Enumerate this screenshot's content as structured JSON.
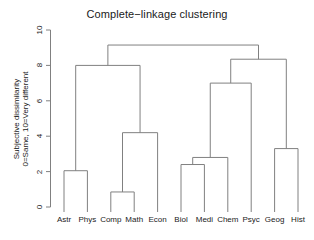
{
  "chart_data": {
    "type": "dendrogram",
    "title": "Complete−linkage clustering",
    "xlabel": "",
    "ylabel": "Subjective dissimilarity\n0=Same, 10=Very different",
    "ylabel_line1": "Subjective dissimilarity",
    "ylabel_line2": "0=Same, 10=Very different",
    "ylim": [
      0,
      10
    ],
    "yticks": [
      0,
      2,
      4,
      6,
      8,
      10
    ],
    "ytick_labels": [
      "0",
      "2",
      "4",
      "6",
      "8",
      "10"
    ],
    "grid": false,
    "legend": "none",
    "leaves": [
      "Astr",
      "Phys",
      "Comp",
      "Math",
      "Econ",
      "Biol",
      "Medi",
      "Chem",
      "Psyc",
      "Geog",
      "Hist"
    ],
    "leaf_positions": [
      1,
      2,
      3,
      4,
      5,
      6,
      7,
      8,
      9,
      10,
      11
    ],
    "merges": [
      {
        "id": "m1",
        "label": "Comp-Math",
        "members": [
          "Comp",
          "Math"
        ],
        "height": 0.85
      },
      {
        "id": "m2",
        "label": "Astr-Phys",
        "members": [
          "Astr",
          "Phys"
        ],
        "height": 2.05
      },
      {
        "id": "m3",
        "label": "Biol-Medi",
        "members": [
          "Biol",
          "Medi"
        ],
        "height": 2.4
      },
      {
        "id": "m4",
        "label": "(Biol,Medi)-Chem",
        "members": [
          "Biol",
          "Medi",
          "Chem"
        ],
        "height": 2.8
      },
      {
        "id": "m5",
        "label": "Geog-Hist",
        "members": [
          "Geog",
          "Hist"
        ],
        "height": 3.3
      },
      {
        "id": "m6",
        "label": "(Comp,Math)-Econ",
        "members": [
          "Comp",
          "Math",
          "Econ"
        ],
        "height": 4.2
      },
      {
        "id": "m7",
        "label": "(Biol,Medi,Chem)-Psyc",
        "members": [
          "Biol",
          "Medi",
          "Chem",
          "Psyc"
        ],
        "height": 7.0
      },
      {
        "id": "m8",
        "label": "(Astr,Phys)-(Comp,Math,Econ)",
        "members": [
          "Astr",
          "Phys",
          "Comp",
          "Math",
          "Econ"
        ],
        "height": 8.0
      },
      {
        "id": "m9",
        "label": "(Biol,Medi,Chem,Psyc)-(Geog,Hist)",
        "members": [
          "Biol",
          "Medi",
          "Chem",
          "Psyc",
          "Geog",
          "Hist"
        ],
        "height": 8.35
      },
      {
        "id": "m10",
        "label": "root",
        "members": [
          "Astr",
          "Phys",
          "Comp",
          "Math",
          "Econ",
          "Biol",
          "Medi",
          "Chem",
          "Psyc",
          "Geog",
          "Hist"
        ],
        "height": 9.15
      }
    ],
    "colors": {
      "line": "#808080",
      "axis": "#808080",
      "text": "#1a1a1a",
      "background": "#ffffff"
    }
  }
}
